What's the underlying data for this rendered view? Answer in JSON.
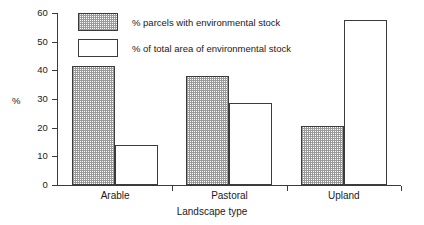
{
  "chart_data": {
    "type": "bar",
    "title": "",
    "subtitle": "",
    "xlabel": "Landscape type",
    "ylabel": "%",
    "categories": [
      "Arable",
      "Pastoral",
      "Upland"
    ],
    "series": [
      {
        "name": "% parcels with environmental stock",
        "style": "hatched",
        "values": [
          41.5,
          38.0,
          20.5
        ]
      },
      {
        "name": "% of total area of environmental stock",
        "style": "open",
        "values": [
          14.0,
          28.5,
          57.5
        ]
      }
    ],
    "ylim": [
      0,
      60
    ],
    "yticks": [
      0,
      10,
      20,
      30,
      40,
      50,
      60
    ],
    "ytick_labels": [
      "0",
      "10",
      "20",
      "30",
      "40",
      "50",
      "60"
    ],
    "grid": false,
    "legend_position": "top-left-inside",
    "colors": {
      "axis": "#3b3b3b",
      "hatch": "#9a9a9a",
      "background": "#ffffff",
      "text": "#1a1a1a"
    }
  },
  "legend": {
    "items": [
      {
        "label": "% parcels with environmental stock"
      },
      {
        "label": "% of total area of environmental stock"
      }
    ]
  },
  "axes": {
    "y_title": "%",
    "x_title": "Landscape type"
  }
}
